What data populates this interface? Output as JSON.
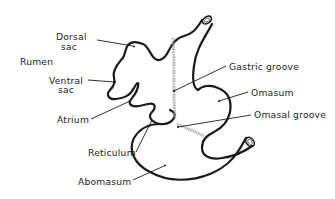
{
  "diagram": {
    "labels": {
      "rumen": "Rumen",
      "dorsal_sac_1": "Dorsal",
      "dorsal_sac_2": "sac",
      "ventral_sac_1": "Ventral",
      "ventral_sac_2": "sac",
      "atrium": "Atrium",
      "reticulum": "Reticulum",
      "abomasum": "Abomasum",
      "gastric_groove": "Gastric groove",
      "omasum": "Omasum",
      "omasal_groove": "Omasal groove"
    },
    "colors": {
      "outline": "#1a1a1a",
      "groove_shading": "#9a9a9a",
      "background": "#ffffff"
    }
  }
}
